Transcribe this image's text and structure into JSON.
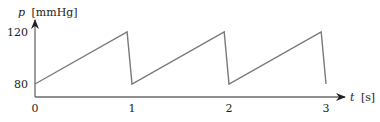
{
  "chart_data": {
    "type": "line",
    "title": "",
    "xlabel": "t [s]",
    "ylabel": "p [mmHg]",
    "xlabel_var": "t",
    "xlabel_unit": "[s]",
    "ylabel_var": "p",
    "ylabel_unit": "[mmHg]",
    "x_ticks": [
      0,
      1,
      2,
      3
    ],
    "y_ticks": [
      80,
      120
    ],
    "xlim": [
      0,
      3.2
    ],
    "ylim": [
      70,
      130
    ],
    "grid": false,
    "series": [
      {
        "name": "pressure",
        "x": [
          0,
          0.95,
          1.0,
          1.95,
          2.0,
          2.95,
          3.0
        ],
        "y": [
          80,
          120,
          80,
          120,
          80,
          120,
          80
        ]
      }
    ],
    "colors": {
      "line": "#7a7a7a",
      "axis": "#6a6a6a",
      "text": "#222222"
    }
  }
}
